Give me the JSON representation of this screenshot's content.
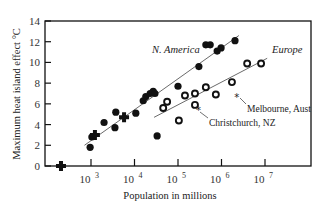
{
  "chart_data": {
    "type": "scatter",
    "title": "",
    "xlabel": "Population in millions",
    "ylabel": "Maximum heat island effect °C",
    "x_scale": "log",
    "xlim_log10": [
      1.9,
      7.5
    ],
    "ylim": [
      0,
      14
    ],
    "x_ticks": [
      {
        "exp": "3",
        "base": "10",
        "value": 1000
      },
      {
        "exp": "4",
        "base": "10",
        "value": 10000
      },
      {
        "exp": "5",
        "base": "10",
        "value": 100000
      },
      {
        "exp": "6",
        "base": "10",
        "value": 1000000
      },
      {
        "exp": "7",
        "base": "10",
        "value": 10000000
      }
    ],
    "y_ticks": [
      0,
      2,
      4,
      6,
      8,
      10,
      12,
      14
    ],
    "grid": false,
    "series": [
      {
        "name": "N. America",
        "marker": "filled-circle",
        "points_log10x": [
          [
            2.98,
            1.8
          ],
          [
            3.02,
            2.8
          ],
          [
            3.3,
            4.2
          ],
          [
            3.55,
            3.7
          ],
          [
            3.57,
            5.2
          ],
          [
            4.03,
            5.1
          ],
          [
            4.2,
            6.3
          ],
          [
            4.26,
            6.7
          ],
          [
            4.36,
            7.0
          ],
          [
            4.43,
            7.2
          ],
          [
            4.47,
            7.0
          ],
          [
            4.52,
            2.9
          ],
          [
            5.0,
            7.7
          ],
          [
            5.48,
            9.6
          ],
          [
            5.64,
            11.7
          ],
          [
            5.74,
            11.7
          ],
          [
            5.9,
            11.1
          ],
          [
            5.99,
            11.4
          ],
          [
            6.31,
            12.1
          ]
        ],
        "fit_line_log10x": [
          [
            2.85,
            2.0
          ],
          [
            6.4,
            12.6
          ]
        ]
      },
      {
        "name": "Europe",
        "marker": "open-circle",
        "points_log10x": [
          [
            4.66,
            5.6
          ],
          [
            4.75,
            6.2
          ],
          [
            5.02,
            4.4
          ],
          [
            5.16,
            6.8
          ],
          [
            5.39,
            7.0
          ],
          [
            5.39,
            5.9
          ],
          [
            5.64,
            7.6
          ],
          [
            5.87,
            6.9
          ],
          [
            6.24,
            8.1
          ],
          [
            6.59,
            9.9
          ],
          [
            6.91,
            9.9
          ]
        ],
        "fit_line_log10x": [
          [
            4.45,
            4.7
          ],
          [
            7.05,
            10.4
          ]
        ]
      },
      {
        "name": "Other",
        "marker": "cross",
        "points_log10x": [
          [
            2.31,
            0.0
          ],
          [
            3.09,
            3.0
          ],
          [
            3.76,
            4.7
          ]
        ]
      },
      {
        "name": "Annotated",
        "marker": "asterisk",
        "points_log10x": [
          [
            5.47,
            5.4
          ],
          [
            6.35,
            6.7
          ]
        ]
      }
    ],
    "annotations": [
      {
        "text": "N. America",
        "style": "italic"
      },
      {
        "text": "Europe",
        "style": "italic"
      },
      {
        "text": "Melbourne, Aust"
      },
      {
        "text": "Christchurch, NZ"
      }
    ]
  },
  "labels": {
    "xlabel": "Population in millions",
    "ylabel": "Maximum heat island effect °C",
    "na": "N. America",
    "eu": "Europe",
    "melbourne": "Melbourne, Aust",
    "christchurch": "Christchurch, NZ"
  }
}
